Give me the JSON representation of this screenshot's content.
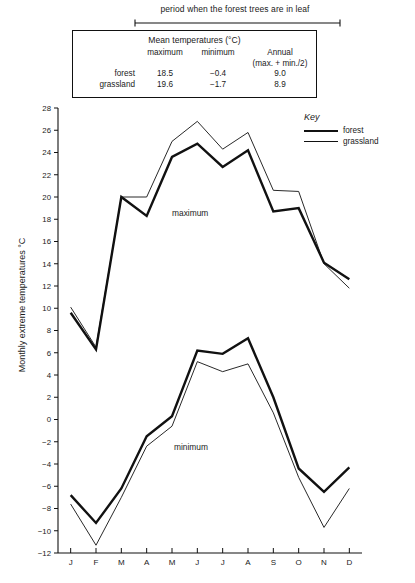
{
  "bracket": {
    "label": "period when the forest trees are in leaf"
  },
  "table": {
    "title": "Mean temperatures (°C)",
    "headers": [
      "",
      "maximum",
      "minimum",
      "Annual"
    ],
    "annual_sub": "(max. + min./2)",
    "rows": [
      {
        "label": "forest",
        "maximum": "18.5",
        "minimum": "−0.4",
        "annual": "9.0"
      },
      {
        "label": "grassland",
        "maximum": "19.6",
        "minimum": "−1.7",
        "annual": "8.9"
      }
    ]
  },
  "key": {
    "title": "Key",
    "items": [
      {
        "label": "forest",
        "style": "thick",
        "color": "#111111"
      },
      {
        "label": "grassland",
        "style": "thin",
        "color": "#111111"
      }
    ]
  },
  "annotations": {
    "maximum": "maximum",
    "minimum": "minimum"
  },
  "chart_data": {
    "type": "line",
    "title": "",
    "xlabel": "",
    "ylabel": "Monthly extreme temperatures °C",
    "categories": [
      "J",
      "F",
      "M",
      "A",
      "M",
      "J",
      "J",
      "A",
      "S",
      "O",
      "N",
      "D"
    ],
    "ylim": [
      -12,
      28
    ],
    "ytick_step": 2,
    "yticks": [
      28,
      26,
      24,
      22,
      20,
      18,
      16,
      14,
      12,
      10,
      8,
      6,
      4,
      2,
      0,
      -2,
      -4,
      -6,
      -8,
      -10,
      -12
    ],
    "ytick_labels": [
      "28",
      "26",
      "24",
      "22",
      "20",
      "18",
      "16",
      "14",
      "12",
      "10",
      "8",
      "6",
      "4",
      "2",
      "0",
      "−2",
      "−4",
      "−6",
      "−8",
      "−10",
      "−12"
    ],
    "grid": false,
    "legend_position": "right-top",
    "series": [
      {
        "name": "forest maximum",
        "group": "maximum",
        "style": "thick",
        "values": [
          9.6,
          6.3,
          20.0,
          18.3,
          23.6,
          24.8,
          22.7,
          24.2,
          18.7,
          19.0,
          14.1,
          12.6
        ]
      },
      {
        "name": "grassland maximum",
        "group": "maximum",
        "style": "thin",
        "values": [
          10.1,
          6.5,
          20.0,
          20.0,
          25.0,
          26.8,
          24.3,
          25.8,
          20.6,
          20.5,
          14.0,
          11.8
        ]
      },
      {
        "name": "forest minimum",
        "group": "minimum",
        "style": "thick",
        "values": [
          -6.8,
          -9.3,
          -6.2,
          -1.5,
          0.3,
          6.2,
          5.9,
          7.3,
          2.0,
          -4.4,
          -6.5,
          -4.3
        ]
      },
      {
        "name": "grassland minimum",
        "group": "minimum",
        "style": "thin",
        "values": [
          -7.6,
          -11.3,
          -7.0,
          -2.4,
          -0.6,
          5.2,
          4.3,
          5.0,
          0.6,
          -5.2,
          -9.7,
          -6.2
        ]
      }
    ]
  }
}
